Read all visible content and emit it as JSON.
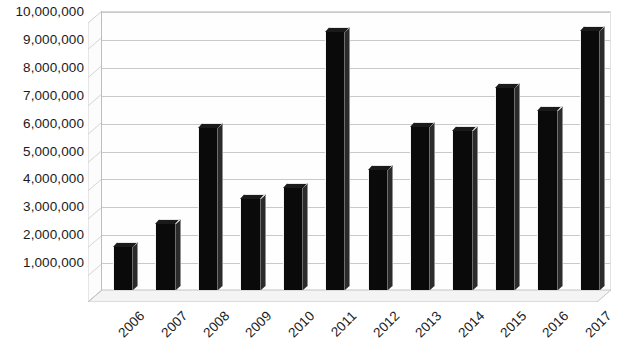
{
  "chart_data": {
    "type": "bar",
    "title": "",
    "xlabel": "",
    "ylabel": "",
    "categories": [
      "2006",
      "2007",
      "2008",
      "2009",
      "2010",
      "2011",
      "2012",
      "2013",
      "2014",
      "2015",
      "2016",
      "2017"
    ],
    "values": [
      1550000,
      2350000,
      5800000,
      3250000,
      3650000,
      9250000,
      4300000,
      5850000,
      5700000,
      7250000,
      6400000,
      9300000
    ],
    "series": [
      {
        "name": "Series 1",
        "values": [
          1550000,
          2350000,
          5800000,
          3250000,
          3650000,
          9250000,
          4300000,
          5850000,
          5700000,
          7250000,
          6400000,
          9300000
        ]
      }
    ],
    "ylim": [
      0,
      10000000
    ],
    "ytick_values": [
      1000000,
      2000000,
      3000000,
      4000000,
      5000000,
      6000000,
      7000000,
      8000000,
      9000000,
      10000000
    ],
    "ytick_labels": [
      "1,000,000",
      "2,000,000",
      "3,000,000",
      "4,000,000",
      "5,000,000",
      "6,000,000",
      "7,000,000",
      "8,000,000",
      "9,000,000",
      "10,000,000"
    ],
    "grid": true,
    "legend": false,
    "legend_position": "none",
    "style": "3d-column",
    "bar_color": "#0a0a0a",
    "grid_color": "#c9c9c9",
    "background_color": "#ffffff",
    "text_color": "#1b1b1b",
    "xtick_rotation": -45
  }
}
